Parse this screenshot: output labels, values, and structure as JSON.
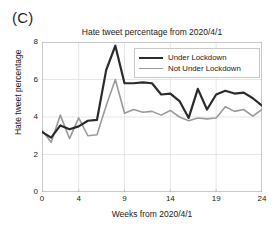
{
  "panel": {
    "label": "(C)"
  },
  "chart_data": {
    "type": "line",
    "title": "Hate tweet percentage from 2020/4/1",
    "xlabel": "Weeks from 2020/4/1",
    "ylabel": "Hate tweet percentage",
    "xlim": [
      0,
      24
    ],
    "ylim": [
      0,
      8
    ],
    "xticks": [
      0,
      4,
      9,
      14,
      19,
      24
    ],
    "xtick_labels": [
      "0",
      "4",
      "9",
      "14",
      "19",
      "24"
    ],
    "yticks": [
      0,
      2,
      4,
      6,
      8
    ],
    "ytick_labels": [
      "0",
      "2",
      "4",
      "6",
      "8"
    ],
    "grid": true,
    "grid_axis": "both",
    "legend_position": "top-right",
    "x": [
      0,
      1,
      2,
      3,
      4,
      5,
      6,
      7,
      8,
      9,
      10,
      11,
      12,
      13,
      14,
      15,
      16,
      17,
      18,
      19,
      20,
      21,
      22,
      23,
      24
    ],
    "series": [
      {
        "name": "Under Lockdown",
        "color": "#2b2b2b",
        "linewidth": 2.2,
        "values": [
          3.2,
          2.9,
          3.55,
          3.35,
          3.5,
          3.8,
          3.85,
          6.5,
          7.8,
          5.8,
          5.8,
          5.85,
          5.8,
          5.2,
          5.25,
          4.85,
          3.95,
          5.5,
          4.4,
          5.2,
          5.4,
          5.25,
          5.3,
          5.0,
          4.6
        ]
      },
      {
        "name": "Not Under Lockdown",
        "color": "#9a9a9a",
        "linewidth": 1.6,
        "values": [
          3.3,
          2.65,
          4.1,
          2.85,
          3.95,
          3.0,
          3.05,
          4.6,
          6.0,
          4.2,
          4.4,
          4.25,
          4.3,
          4.1,
          4.35,
          4.0,
          3.8,
          3.95,
          3.9,
          3.95,
          4.55,
          4.3,
          4.4,
          4.05,
          4.4
        ]
      }
    ]
  },
  "axis_style": {
    "frame_color": "#b4b4b4",
    "grid_color": "#dcdcdc",
    "text_color": "#202020"
  }
}
